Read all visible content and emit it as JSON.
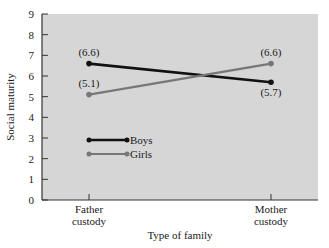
{
  "chart_data": {
    "type": "line",
    "title": "",
    "xlabel": "Type of family",
    "ylabel": "Social maturity",
    "categories": [
      "Father\ncustody",
      "Mother\ncustody"
    ],
    "category_lines": [
      [
        "Father",
        "custody"
      ],
      [
        "Mother",
        "custody"
      ]
    ],
    "ylim": [
      0,
      9
    ],
    "yticks": [
      0,
      1,
      2,
      3,
      4,
      5,
      6,
      7,
      8,
      9
    ],
    "grid": false,
    "legend_position": "inside-lower-left",
    "series": [
      {
        "name": "Boys",
        "values": [
          6.6,
          5.7
        ],
        "labels": [
          "(6.6)",
          "(5.7)"
        ],
        "color": "#111111"
      },
      {
        "name": "Girls",
        "values": [
          5.1,
          6.6
        ],
        "labels": [
          "(5.1)",
          "(6.6)"
        ],
        "color": "#777777"
      }
    ],
    "colors": {
      "plot_background": "#d6d6d6",
      "axis": "#333333"
    }
  }
}
